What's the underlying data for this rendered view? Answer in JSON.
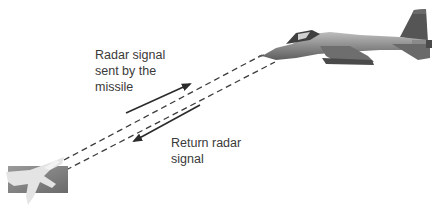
{
  "diagram": {
    "nodes": [
      {
        "id": "missile",
        "label": "",
        "icon": "missile-seeker-image"
      },
      {
        "id": "jet",
        "label": "",
        "icon": "fighter-jet-image"
      }
    ],
    "edges": [
      {
        "from": "missile",
        "to": "jet",
        "label": "Radar signal sent by the missile",
        "style": "solid-arrow"
      },
      {
        "from": "jet",
        "to": "missile",
        "label": "Return radar signal",
        "style": "solid-arrow"
      }
    ],
    "beams": [
      {
        "from": "missile",
        "to": "jet",
        "style": "dashed"
      },
      {
        "from": "missile",
        "to": "jet",
        "style": "dashed"
      }
    ]
  },
  "labels": {
    "outgoing": {
      "line1": "Radar signal",
      "line2": "sent by the",
      "line3": "missile"
    },
    "return": {
      "line1": "Return radar",
      "line2": "signal"
    }
  },
  "colors": {
    "text": "#3a3a3a",
    "arrow": "#2b2b2b",
    "beam": "#3c3c3c",
    "jet_body": "#8a8a8a",
    "jet_dark": "#4a4a4a",
    "missile_box": "#7a7a7a"
  }
}
